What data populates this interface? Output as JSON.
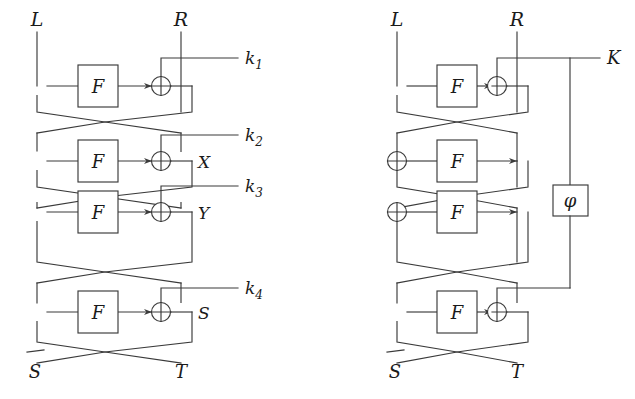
{
  "figure": {
    "type": "diagram",
    "stroke_color": "#3a3a3a",
    "background_color": "#ffffff",
    "text_color": "#1a1a1a"
  },
  "left_diagram": {
    "name": "four-round-feistel-independent-keys",
    "top_labels": {
      "left": "L",
      "right": "R"
    },
    "bottom_labels": {
      "left": "S̄",
      "right": "T"
    },
    "rounds": [
      {
        "index": 1,
        "function_label": "F",
        "key_label": "k₁",
        "key_sub": "1",
        "key_base": "k",
        "intermediate_label": ""
      },
      {
        "index": 2,
        "function_label": "F",
        "key_label": "k₂",
        "key_sub": "2",
        "key_base": "k",
        "intermediate_label": "X"
      },
      {
        "index": 3,
        "function_label": "F",
        "key_label": "k₃",
        "key_sub": "3",
        "key_base": "k",
        "intermediate_label": "Y"
      },
      {
        "index": 4,
        "function_label": "F",
        "key_label": "k₄",
        "key_sub": "4",
        "key_base": "k",
        "intermediate_label": "S"
      }
    ]
  },
  "right_diagram": {
    "name": "four-round-feistel-related-keys",
    "top_labels": {
      "left": "L",
      "right": "R"
    },
    "bottom_labels": {
      "left": "S̄",
      "right": "T"
    },
    "master_key_label": "K",
    "transform_box_label": "φ",
    "rounds": [
      {
        "index": 1,
        "function_label": "F",
        "has_xor": true
      },
      {
        "index": 2,
        "function_label": "F",
        "has_xor": false
      },
      {
        "index": 3,
        "function_label": "F",
        "has_xor": false
      },
      {
        "index": 4,
        "function_label": "F",
        "has_xor": true
      }
    ]
  }
}
